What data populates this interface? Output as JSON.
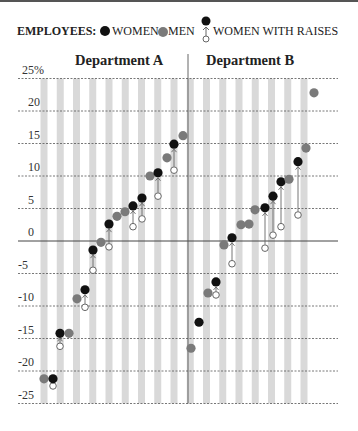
{
  "legend": {
    "title": "EMPLOYEES:",
    "women": "WOMEN",
    "men": "MEN",
    "women_with_raises": "WOMEN WITH RAISES"
  },
  "colors": {
    "women": "#111111",
    "men": "#7a7a7a",
    "stripe": "#d9d9d9",
    "grid": "#555555",
    "raise_arrow": "#666666"
  },
  "chart_data": {
    "type": "scatter",
    "title": "",
    "ylabel": "Percent",
    "ylim": [
      -25,
      25
    ],
    "yticks": [
      25,
      20,
      15,
      10,
      5,
      0,
      -5,
      -10,
      -15,
      -20,
      -25
    ],
    "ytick_labels": [
      "25%",
      "20",
      "15",
      "10",
      "5",
      "0",
      "-5",
      "-10",
      "-15",
      "-20",
      "-25"
    ],
    "grid": true,
    "legend_position": "top",
    "legend": [
      "WOMEN",
      "MEN",
      "WOMEN WITH RAISES"
    ],
    "panels": [
      {
        "name": "Department A",
        "points": [
          {
            "x": 44,
            "group": "men",
            "value": -21.2
          },
          {
            "x": 53,
            "group": "women",
            "value": -21.2,
            "before_raise": -22.3
          },
          {
            "x": 60,
            "group": "women",
            "value": -14.2,
            "before_raise": -16.2
          },
          {
            "x": 69,
            "group": "men",
            "value": -14.2
          },
          {
            "x": 77,
            "group": "men",
            "value": -8.9
          },
          {
            "x": 85,
            "group": "women",
            "value": -7.5,
            "before_raise": -10.2
          },
          {
            "x": 93,
            "group": "women",
            "value": -1.4,
            "before_raise": -4.5
          },
          {
            "x": 101,
            "group": "men",
            "value": -0.2
          },
          {
            "x": 109,
            "group": "women",
            "value": 2.6,
            "before_raise": -0.9
          },
          {
            "x": 117,
            "group": "men",
            "value": 3.8
          },
          {
            "x": 125,
            "group": "men",
            "value": 4.5
          },
          {
            "x": 133,
            "group": "women",
            "value": 5.4,
            "before_raise": 2.2
          },
          {
            "x": 142,
            "group": "women",
            "value": 6.6,
            "before_raise": 3.4
          },
          {
            "x": 150,
            "group": "men",
            "value": 10.0
          },
          {
            "x": 158,
            "group": "women",
            "value": 10.5,
            "before_raise": 6.9
          },
          {
            "x": 167,
            "group": "men",
            "value": 12.8
          },
          {
            "x": 174,
            "group": "women",
            "value": 14.9,
            "before_raise": 10.9
          },
          {
            "x": 183,
            "group": "men",
            "value": 16.2
          }
        ]
      },
      {
        "name": "Department B",
        "points": [
          {
            "x": 191,
            "group": "men",
            "value": -16.5
          },
          {
            "x": 199,
            "group": "women",
            "value": -12.5
          },
          {
            "x": 208,
            "group": "men",
            "value": -8.0
          },
          {
            "x": 216,
            "group": "women",
            "value": -6.3,
            "before_raise": -8.3
          },
          {
            "x": 224,
            "group": "men",
            "value": -0.6
          },
          {
            "x": 232,
            "group": "women",
            "value": 0.5,
            "before_raise": -3.5
          },
          {
            "x": 241,
            "group": "men",
            "value": 2.5
          },
          {
            "x": 249,
            "group": "men",
            "value": 2.6
          },
          {
            "x": 255,
            "group": "men",
            "value": 4.8
          },
          {
            "x": 265,
            "group": "women",
            "value": 5.1,
            "before_raise": -1.1
          },
          {
            "x": 273,
            "group": "women",
            "value": 6.9,
            "before_raise": 0.9
          },
          {
            "x": 281,
            "group": "women",
            "value": 9.1,
            "before_raise": 2.2
          },
          {
            "x": 289,
            "group": "men",
            "value": 9.5
          },
          {
            "x": 298,
            "group": "women",
            "value": 12.2,
            "before_raise": 4.0
          },
          {
            "x": 306,
            "group": "men",
            "value": 14.3
          },
          {
            "x": 314,
            "group": "men",
            "value": 22.8
          }
        ]
      }
    ]
  }
}
